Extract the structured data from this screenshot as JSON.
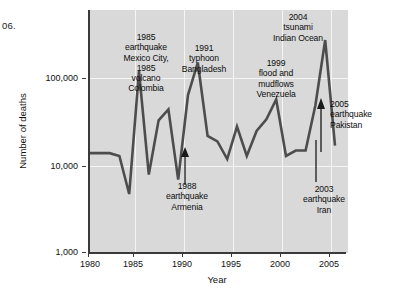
{
  "margin_note": "06.",
  "chart_data": {
    "type": "line",
    "title": "",
    "xlabel": "Year",
    "ylabel": "Number of deaths",
    "xlim": [
      1980,
      2006
    ],
    "ylim": [
      1000,
      320000
    ],
    "yscale": "log",
    "grid": true,
    "legend_position": "none",
    "x_ticks": [
      "1980",
      "1985",
      "1990",
      "1995",
      "2000",
      "2005"
    ],
    "x_tick_values": [
      1980,
      1985,
      1990,
      1995,
      2000,
      2005
    ],
    "y_ticks": [
      "1,000",
      "10,000",
      "100,000"
    ],
    "y_tick_values": [
      1000,
      10000,
      100000
    ],
    "series": [
      {
        "name": "Number of deaths",
        "x": [
          1980,
          1981,
          1982,
          1983,
          1984,
          1985,
          1986,
          1987,
          1988,
          1989,
          1990,
          1991,
          1992,
          1993,
          1994,
          1995,
          1996,
          1997,
          1998,
          1999,
          2000,
          2001,
          2002,
          2003,
          2004,
          2005
        ],
        "values": [
          14000,
          14000,
          14000,
          13000,
          4800,
          120000,
          8000,
          33000,
          44000,
          7000,
          64000,
          150000,
          22000,
          19000,
          12000,
          28000,
          13000,
          25000,
          34000,
          57000,
          13000,
          15000,
          15000,
          49000,
          270000,
          17000
        ]
      }
    ],
    "annotations": [
      {
        "id": "mexico-colombia-1985",
        "text": "1985\nearthquake\nMexico City,\n1985\nvolcano\nColombia",
        "year": 1985,
        "has_arrow": false
      },
      {
        "id": "bangladesh-1991",
        "text": "1991\ntyphoon\nBangladesh",
        "year": 1991,
        "has_arrow": false
      },
      {
        "id": "tsunami-2004",
        "text": "2004\ntsunami\nIndian Ocean",
        "year": 2004,
        "has_arrow": false
      },
      {
        "id": "venezuela-1999",
        "text": "1999\nflood and\nmudflows\nVenezuela",
        "year": 1999,
        "has_arrow": false
      },
      {
        "id": "pakistan-2005",
        "text": "2005\nearthquake\nPakistan",
        "year": 2005,
        "has_arrow": true
      },
      {
        "id": "armenia-1988",
        "text": "1988\nearthquake\nArmenia",
        "year": 1988,
        "has_arrow": true
      },
      {
        "id": "iran-2003",
        "text": "2003\nearthquake\nIran",
        "year": 2003,
        "has_arrow": true
      }
    ],
    "colors": {
      "line": "#4d4d4d",
      "plot_background": "#d9d9d9",
      "axis": "#3a3a3a",
      "gridline": "#f4f4f4",
      "text": "#111111"
    }
  }
}
